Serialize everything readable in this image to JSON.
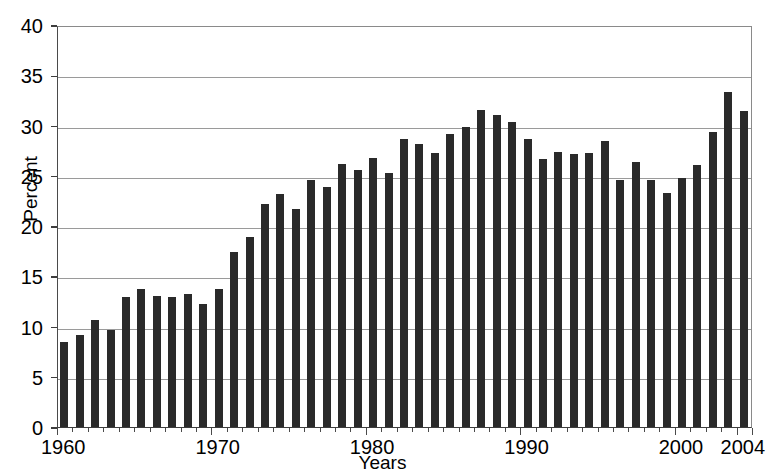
{
  "chart_data": {
    "type": "bar",
    "title": "",
    "xlabel": "Years",
    "ylabel": "Percent",
    "ylim": [
      0,
      40
    ],
    "ytick_values": [
      0,
      5,
      10,
      15,
      20,
      25,
      30,
      35,
      40
    ],
    "ytick_labels": [
      "0",
      "5",
      "10",
      "15",
      "20",
      "25",
      "30",
      "35",
      "40"
    ],
    "xtick_labels": [
      "1960",
      "1970",
      "1980",
      "1990",
      "2000",
      "2004"
    ],
    "xtick_years": [
      1960,
      1970,
      1980,
      1990,
      2000,
      2004
    ],
    "grid": "horizontal",
    "legend": "none",
    "bar_color": "#2a2a2a",
    "categories": [
      "1960",
      "1961",
      "1962",
      "1963",
      "1964",
      "1965",
      "1966",
      "1967",
      "1968",
      "1969",
      "1970",
      "1971",
      "1972",
      "1973",
      "1974",
      "1975",
      "1976",
      "1977",
      "1978",
      "1979",
      "1980",
      "1981",
      "1982",
      "1983",
      "1984",
      "1985",
      "1986",
      "1987",
      "1988",
      "1989",
      "1990",
      "1991",
      "1992",
      "1993",
      "1994",
      "1995",
      "1996",
      "1997",
      "1998",
      "1999",
      "2000",
      "2001",
      "2002",
      "2003",
      "2004"
    ],
    "values": [
      8.5,
      9.2,
      10.7,
      9.7,
      12.9,
      13.7,
      13.0,
      12.9,
      13.2,
      12.2,
      13.7,
      17.4,
      18.9,
      22.2,
      23.2,
      21.7,
      24.6,
      23.9,
      26.2,
      25.6,
      26.8,
      25.3,
      28.7,
      28.2,
      27.3,
      29.2,
      29.9,
      31.5,
      31.0,
      30.4,
      28.7,
      26.7,
      27.4,
      27.2,
      27.3,
      28.5,
      24.6,
      26.4,
      24.6,
      23.3,
      24.8,
      26.1,
      29.4,
      33.3,
      31.4
    ],
    "value_unit": "percent",
    "x_start_year": 1960,
    "x_end_year": 2004
  }
}
